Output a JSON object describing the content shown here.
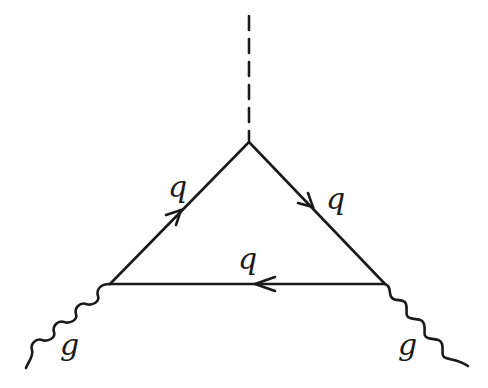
{
  "diagram": {
    "type": "feynman-diagram",
    "colors": {
      "line": "#1a1a1a",
      "background": "#ffffff"
    },
    "vertices": {
      "top": [
        249,
        142
      ],
      "left": [
        110,
        284
      ],
      "right": [
        385,
        284
      ]
    },
    "edges": [
      {
        "id": "scalar",
        "style": "dashed",
        "from": [
          249,
          15
        ],
        "to": [
          249,
          142
        ]
      },
      {
        "id": "quark-left",
        "style": "solid-arrow",
        "label": "q",
        "direction": "left-to-top"
      },
      {
        "id": "quark-right",
        "style": "solid-arrow",
        "label": "q",
        "direction": "top-to-right"
      },
      {
        "id": "quark-bottom",
        "style": "solid-arrow",
        "label": "q",
        "direction": "right-to-left"
      },
      {
        "id": "gluon-left",
        "style": "wavy",
        "label": "g"
      },
      {
        "id": "gluon-right",
        "style": "wavy",
        "label": "g"
      }
    ],
    "labels": {
      "q_left": "q",
      "q_right": "q",
      "q_bottom": "q",
      "g_left": "g",
      "g_right": "g"
    }
  }
}
